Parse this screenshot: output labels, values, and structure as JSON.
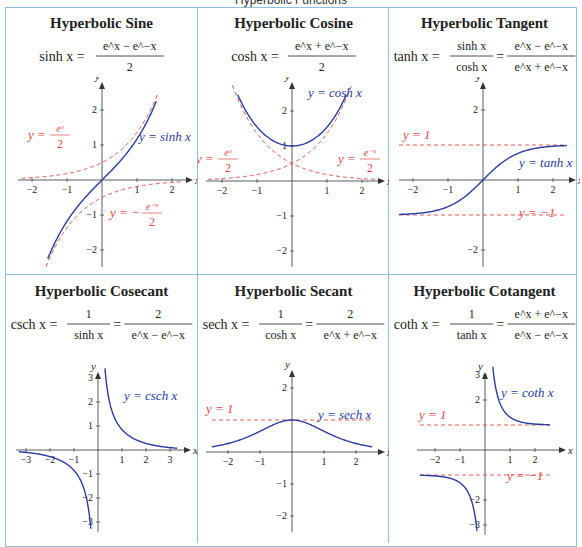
{
  "title": "Hyperbolic Functions",
  "colors": {
    "border": "#8fbde0",
    "curve": "#2b3a9e",
    "asymptote": "#e04848",
    "axis": "#333333"
  },
  "cells": [
    {
      "title": "Hyperbolic Sine",
      "formula": "sinh x = (e^x − e^−x)/2",
      "lhs": "sinh x =",
      "num1": "e^x − e^−x",
      "den1": "2",
      "curve_label": "y = sinh x",
      "guides": [
        "y = e^x/2",
        "y = −e^−x/2"
      ]
    },
    {
      "title": "Hyperbolic Cosine",
      "formula": "cosh x = (e^x + e^−x)/2",
      "lhs": "cosh x =",
      "num1": "e^x + e^−x",
      "den1": "2",
      "curve_label": "y = cosh x",
      "guides": [
        "y = e^x/2",
        "y = e^−x/2"
      ]
    },
    {
      "title": "Hyperbolic Tangent",
      "formula": "tanh x = sinh x / cosh x = (e^x − e^−x)/(e^x + e^−x)",
      "lhs": "tanh x =",
      "num1": "sinh x",
      "den1": "cosh x",
      "num2": "e^x − e^−x",
      "den2": "e^x + e^−x",
      "curve_label": "y = tanh x",
      "guides": [
        "y = 1",
        "y = −1"
      ]
    },
    {
      "title": "Hyperbolic Cosecant",
      "formula": "csch x = 1/sinh x = 2/(e^x − e^−x)",
      "lhs": "csch x =",
      "num1": "1",
      "den1": "sinh x",
      "num2": "2",
      "den2": "e^x − e^−x",
      "curve_label": "y = csch x",
      "guides": []
    },
    {
      "title": "Hyperbolic Secant",
      "formula": "sech x = 1/cosh x = 2/(e^x + e^−x)",
      "lhs": "sech x =",
      "num1": "1",
      "den1": "cosh x",
      "num2": "2",
      "den2": "e^x + e^−x",
      "curve_label": "y = sech x",
      "guides": [
        "y = 1"
      ]
    },
    {
      "title": "Hyperbolic Cotangent",
      "formula": "coth x = 1/tanh x = (e^x + e^−x)/(e^x − e^−x)",
      "lhs": "coth x =",
      "num1": "1",
      "den1": "tanh x",
      "num2": "e^x + e^−x",
      "den2": "e^x − e^−x",
      "curve_label": "y = coth x",
      "guides": [
        "y = 1",
        "y = −1"
      ]
    }
  ],
  "axes": {
    "x_label": "x",
    "y_label": "y"
  }
}
